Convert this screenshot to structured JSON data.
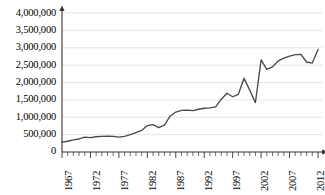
{
  "chart_data": {
    "type": "line",
    "title": "",
    "xlabel": "",
    "ylabel": "",
    "xlim": [
      1967,
      2012
    ],
    "ylim": [
      0,
      4000000
    ],
    "grid": true,
    "legend": false,
    "legend_position": "none",
    "y_ticks": [
      0,
      500000,
      1000000,
      1500000,
      2000000,
      2500000,
      3000000,
      3500000,
      4000000
    ],
    "y_tick_labels": [
      "0",
      "500,000",
      "1,000,000",
      "1,500,000",
      "2,000,000",
      "2,500,000",
      "3,000,000",
      "3,500,000",
      "4,000,000"
    ],
    "x_ticks": [
      1967,
      1972,
      1977,
      1982,
      1987,
      1992,
      1997,
      2002,
      2007,
      2012
    ],
    "x_tick_labels": [
      "1967",
      "1972",
      "1977",
      "1982",
      "1987",
      "1992",
      "1997",
      "2002",
      "2007",
      "2012"
    ],
    "x_minor_tick_interval": 1,
    "line_color": "#4a4a4a",
    "grid_color": "#d9d9d9",
    "axis_color": "#333333",
    "series": [
      {
        "name": "value",
        "x": [
          1967,
          1968,
          1969,
          1970,
          1971,
          1972,
          1973,
          1974,
          1975,
          1976,
          1977,
          1978,
          1979,
          1980,
          1981,
          1982,
          1983,
          1984,
          1985,
          1986,
          1987,
          1988,
          1989,
          1990,
          1991,
          1992,
          1993,
          1994,
          1995,
          1996,
          1997,
          1998,
          1999,
          2000,
          2001,
          2002,
          2003,
          2004,
          2005,
          2006,
          2007,
          2008,
          2009,
          2010,
          2011,
          2012
        ],
        "values": [
          285000,
          310000,
          350000,
          375000,
          430000,
          415000,
          440000,
          450000,
          455000,
          450000,
          430000,
          450000,
          500000,
          560000,
          620000,
          760000,
          790000,
          700000,
          770000,
          1030000,
          1150000,
          1200000,
          1205000,
          1190000,
          1230000,
          1260000,
          1270000,
          1300000,
          1520000,
          1690000,
          1590000,
          1660000,
          2120000,
          1780000,
          1420000,
          2650000,
          2380000,
          2450000,
          2620000,
          2700000,
          2760000,
          2800000,
          2810000,
          2590000,
          2560000,
          2950000
        ]
      }
    ]
  },
  "axis": {
    "y_axis_name": "y-axis",
    "x_axis_name": "x-axis"
  }
}
